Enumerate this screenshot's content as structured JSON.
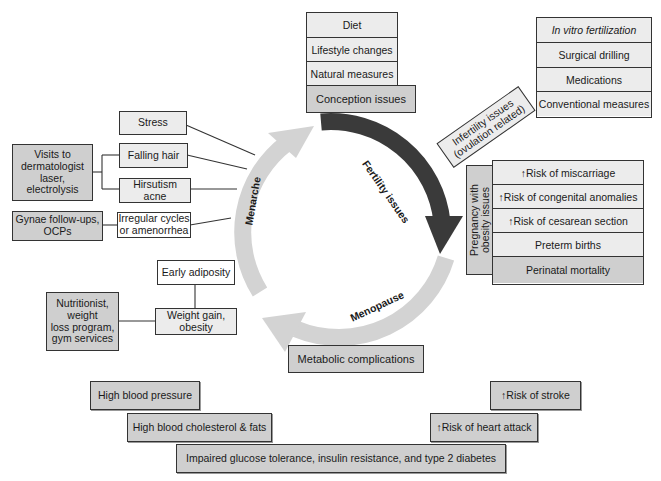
{
  "cycle": {
    "fertility_label": "Fertility issues",
    "menopause_label": "Menopause",
    "menarche_label": "Menarche",
    "colors": {
      "dark_arrow": "#3a3a3a",
      "light_arrow": "#d3d3d3"
    }
  },
  "conception": {
    "items": [
      "Diet",
      "Lifestyle changes",
      "Natural measures"
    ],
    "header": "Conception issues"
  },
  "infertility": {
    "label_line1": "Infertility issues",
    "label_line2": "(ovulation related)",
    "items": [
      "In vitro fertilization",
      "Surgical drilling",
      "Medications",
      "Conventional measures"
    ]
  },
  "pregnancy": {
    "label_line1": "Pregnancy with",
    "label_line2": "obesity issues",
    "items": [
      "↑Risk of miscarriage",
      "↑Risk of congenital anomalies",
      "↑Risk of cesarean section",
      "Preterm births",
      "Perinatal mortality"
    ]
  },
  "menarche_issues": {
    "stress": "Stress",
    "falling_hair": "Falling hair",
    "hirsutism_line1": "Hirsutism",
    "hirsutism_line2": "acne",
    "irregular_line1": "Irregular cycles",
    "irregular_line2": "or amenorrhea",
    "dermatologist": [
      "Visits to",
      "dermatologist",
      "laser,",
      "electrolysis"
    ],
    "gynae_line1": "Gynae follow-ups,",
    "gynae_line2": "OCPs"
  },
  "weight": {
    "early_adiposity": "Early adiposity",
    "weight_gain_line1": "Weight gain,",
    "weight_gain_line2": "obesity",
    "nutritionist": [
      "Nutritionist,",
      "weight",
      "loss program,",
      "gym services"
    ]
  },
  "metabolic": {
    "header": "Metabolic complications",
    "high_bp": "High blood pressure",
    "cholesterol": "High blood cholesterol & fats",
    "glucose": "Impaired glucose tolerance, insulin resistance, and type 2 diabetes",
    "stroke": "↑Risk of stroke",
    "heart_attack": "↑Risk of heart attack"
  }
}
